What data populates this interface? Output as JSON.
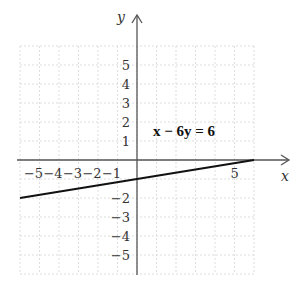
{
  "chart_data": {
    "type": "line",
    "title": "",
    "equation_label": "x − 6y = 6",
    "xlabel": "x",
    "ylabel": "y",
    "xlim": [
      -6,
      6
    ],
    "ylim": [
      -6,
      6
    ],
    "grid": true,
    "x_tick_labels": [
      "−5",
      "−4",
      "−3",
      "−2",
      "−1",
      "5"
    ],
    "x_ticks": [
      -5,
      -4,
      -3,
      -2,
      -1,
      5
    ],
    "y_tick_labels": [
      "5",
      "4",
      "3",
      "2",
      "1",
      "−2",
      "−3",
      "−4",
      "−5"
    ],
    "y_ticks": [
      5,
      4,
      3,
      2,
      1,
      -2,
      -3,
      -4,
      -5
    ],
    "series": [
      {
        "name": "x − 6y = 6",
        "x": [
          -6,
          6
        ],
        "y": [
          -2,
          0
        ],
        "color": "#111111"
      }
    ]
  },
  "labels": {
    "x_axis": "x",
    "y_axis": "y",
    "equation": "x − 6y = 6"
  }
}
